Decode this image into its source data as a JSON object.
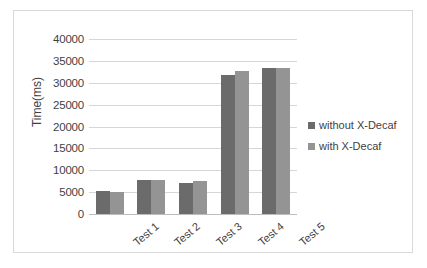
{
  "chart_data": {
    "type": "bar",
    "title": "",
    "xlabel": "",
    "ylabel": "Time(ms)",
    "categories": [
      "Test 1",
      "Test 2",
      "Test 3",
      "Test 4",
      "Test 5"
    ],
    "series": [
      {
        "name": "without X-Decaf",
        "color": "#6b6b6b",
        "values": [
          5300,
          7800,
          7200,
          31700,
          33400
        ]
      },
      {
        "name": "with X-Decaf",
        "color": "#949494",
        "values": [
          5100,
          7800,
          7500,
          32600,
          33400
        ]
      }
    ],
    "ylim": [
      0,
      40000
    ],
    "ytick_labels": [
      "0",
      "5000",
      "10000",
      "15000",
      "20000",
      "25000",
      "30000",
      "35000",
      "40000"
    ],
    "ytick_values": [
      0,
      5000,
      10000,
      15000,
      20000,
      25000,
      30000,
      35000,
      40000
    ],
    "grid": true,
    "legend_position": "right",
    "frame_border_color": "#d9d9d9",
    "gridline_color": "#d6d6d6",
    "text_color": "#3f3f3f",
    "background": "#ffffff"
  },
  "legend": {
    "items": [
      {
        "label": "without X-Decaf"
      },
      {
        "label": "with X-Decaf"
      }
    ]
  }
}
